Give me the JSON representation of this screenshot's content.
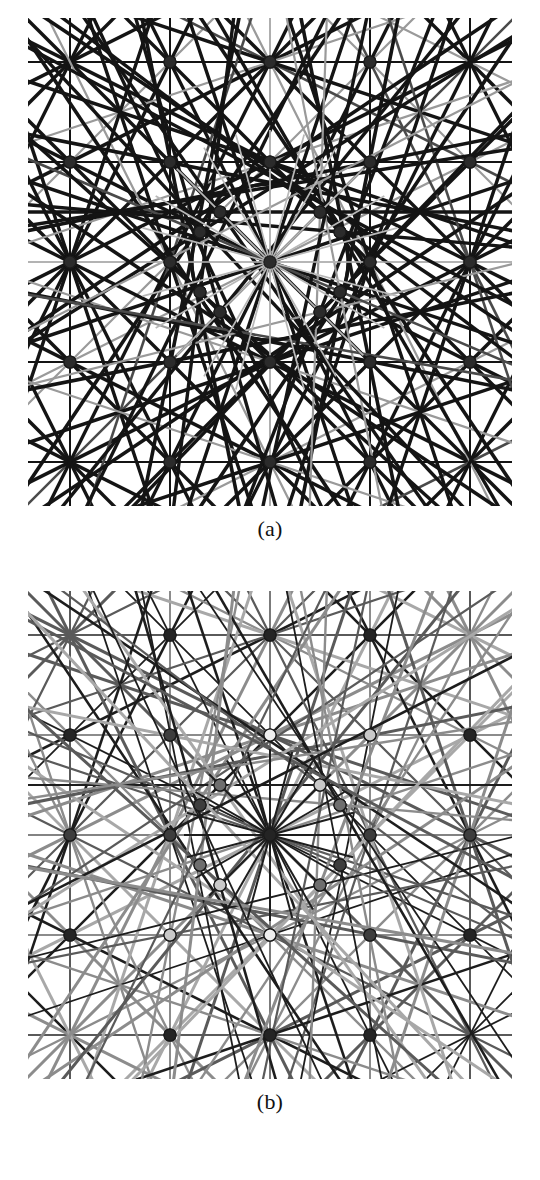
{
  "figure": {
    "background": "#ffffff",
    "width": 540,
    "height": 1180,
    "type": "line-arrangement-diagram",
    "trailing_text": "                                                                    "
  },
  "panels": [
    {
      "id": "a",
      "caption": "(a)",
      "description": "Arrangement of lines, all drawn in near-black with a few light grey lines; all vertices rendered as dark filled dots of uniform dark grey.",
      "node_fill_uniform": "#2b2b2b",
      "palette": {
        "line_dark": "#141414",
        "line_mid": "#4a4a4a",
        "line_light": "#9a9a9a",
        "line_faint": "#b8b8b8",
        "node": "#2b2b2b",
        "background": "#ffffff"
      }
    },
    {
      "id": "b",
      "caption": "(b)",
      "description": "Same arrangement of lines, now shaded by class: lines and vertices take a range of grey levels from black through mid grey to near white.",
      "palette": {
        "line_dark": "#1d1d1d",
        "line_mid": "#5a5a5a",
        "line_light": "#8c8c8c",
        "line_lighter": "#a8a8a8",
        "node_black": "#242424",
        "node_dark": "#3d3d3d",
        "node_mid": "#6e6e6e",
        "node_lightmid": "#9c9c9c",
        "node_light": "#c9c9c9",
        "node_white": "#efefef",
        "background": "#ffffff"
      }
    }
  ],
  "chart_data": {
    "type": "scatter",
    "title": "",
    "xlabel": "",
    "ylabel": "",
    "grid": false,
    "legend": "none",
    "geometry": {
      "center": [
        242,
        244
      ],
      "square_grid_step": 100,
      "inner_ring_radius": 78,
      "radial_fan_count": 24,
      "symmetry": "6-fold dihedral with square sublattice",
      "line_directions_deg": [
        0,
        30,
        60,
        90,
        120,
        150,
        15,
        45,
        75,
        105,
        135,
        165
      ],
      "vertex_ring_counts": [
        1,
        6,
        6,
        12,
        12
      ]
    },
    "panel_a_nodes": [
      {
        "x": 242,
        "y": 244,
        "shade": "#2b2b2b"
      },
      {
        "x": 142,
        "y": 244,
        "shade": "#2b2b2b"
      },
      {
        "x": 342,
        "y": 244,
        "shade": "#2b2b2b"
      },
      {
        "x": 242,
        "y": 144,
        "shade": "#2b2b2b"
      },
      {
        "x": 242,
        "y": 344,
        "shade": "#2b2b2b"
      },
      {
        "x": 142,
        "y": 144,
        "shade": "#2b2b2b"
      },
      {
        "x": 342,
        "y": 144,
        "shade": "#2b2b2b"
      },
      {
        "x": 142,
        "y": 344,
        "shade": "#2b2b2b"
      },
      {
        "x": 342,
        "y": 344,
        "shade": "#2b2b2b"
      },
      {
        "x": 42,
        "y": 244,
        "shade": "#2b2b2b"
      },
      {
        "x": 442,
        "y": 244,
        "shade": "#2b2b2b"
      },
      {
        "x": 242,
        "y": 44,
        "shade": "#2b2b2b"
      },
      {
        "x": 242,
        "y": 444,
        "shade": "#2b2b2b"
      },
      {
        "x": 42,
        "y": 144,
        "shade": "#2b2b2b"
      },
      {
        "x": 442,
        "y": 144,
        "shade": "#2b2b2b"
      },
      {
        "x": 42,
        "y": 344,
        "shade": "#2b2b2b"
      },
      {
        "x": 442,
        "y": 344,
        "shade": "#2b2b2b"
      },
      {
        "x": 142,
        "y": 44,
        "shade": "#2b2b2b"
      },
      {
        "x": 342,
        "y": 44,
        "shade": "#2b2b2b"
      },
      {
        "x": 142,
        "y": 444,
        "shade": "#2b2b2b"
      },
      {
        "x": 342,
        "y": 444,
        "shade": "#2b2b2b"
      },
      {
        "x": 192,
        "y": 194,
        "shade": "#2b2b2b"
      },
      {
        "x": 292,
        "y": 194,
        "shade": "#2b2b2b"
      },
      {
        "x": 192,
        "y": 294,
        "shade": "#2b2b2b"
      },
      {
        "x": 292,
        "y": 294,
        "shade": "#2b2b2b"
      },
      {
        "x": 172,
        "y": 214,
        "shade": "#2b2b2b"
      },
      {
        "x": 312,
        "y": 214,
        "shade": "#2b2b2b"
      },
      {
        "x": 172,
        "y": 274,
        "shade": "#2b2b2b"
      },
      {
        "x": 312,
        "y": 274,
        "shade": "#2b2b2b"
      }
    ],
    "panel_b_nodes": [
      {
        "x": 242,
        "y": 244,
        "shade": "#242424"
      },
      {
        "x": 142,
        "y": 244,
        "shade": "#efefef"
      },
      {
        "x": 342,
        "y": 244,
        "shade": "#3d3d3d"
      },
      {
        "x": 242,
        "y": 144,
        "shade": "#c9c9c9"
      },
      {
        "x": 242,
        "y": 344,
        "shade": "#efefef"
      },
      {
        "x": 142,
        "y": 144,
        "shade": "#3d3d3d"
      },
      {
        "x": 342,
        "y": 144,
        "shade": "#efefef"
      },
      {
        "x": 142,
        "y": 344,
        "shade": "#3d3d3d"
      },
      {
        "x": 342,
        "y": 344,
        "shade": "#c9c9c9"
      },
      {
        "x": 42,
        "y": 244,
        "shade": "#6e6e6e"
      },
      {
        "x": 442,
        "y": 244,
        "shade": "#3d3d3d"
      },
      {
        "x": 242,
        "y": 44,
        "shade": "#242424"
      },
      {
        "x": 242,
        "y": 444,
        "shade": "#242424"
      },
      {
        "x": 42,
        "y": 144,
        "shade": "#242424"
      },
      {
        "x": 442,
        "y": 144,
        "shade": "#242424"
      },
      {
        "x": 42,
        "y": 344,
        "shade": "#242424"
      },
      {
        "x": 442,
        "y": 344,
        "shade": "#242424"
      },
      {
        "x": 142,
        "y": 44,
        "shade": "#242424"
      },
      {
        "x": 342,
        "y": 44,
        "shade": "#9c9c9c"
      },
      {
        "x": 142,
        "y": 444,
        "shade": "#242424"
      },
      {
        "x": 342,
        "y": 444,
        "shade": "#242424"
      },
      {
        "x": 192,
        "y": 194,
        "shade": "#6e6e6e"
      },
      {
        "x": 292,
        "y": 194,
        "shade": "#3d3d3d"
      },
      {
        "x": 192,
        "y": 294,
        "shade": "#6e6e6e"
      },
      {
        "x": 292,
        "y": 294,
        "shade": "#c9c9c9"
      },
      {
        "x": 172,
        "y": 214,
        "shade": "#efefef"
      },
      {
        "x": 312,
        "y": 214,
        "shade": "#c9c9c9"
      },
      {
        "x": 172,
        "y": 274,
        "shade": "#3d3d3d"
      },
      {
        "x": 312,
        "y": 274,
        "shade": "#6e6e6e"
      }
    ]
  }
}
